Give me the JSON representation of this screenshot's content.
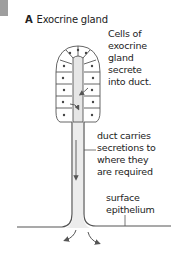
{
  "figure": {
    "panel_letter": "A",
    "title": "Exocrine gland"
  },
  "labels": {
    "cells": [
      "Cells of",
      "exocrine",
      "gland",
      "secrete",
      "into duct."
    ],
    "duct": [
      "duct carries",
      "secretions to",
      "where they",
      "are required"
    ],
    "epithelium": [
      "surface",
      "epithelium"
    ]
  },
  "colors": {
    "line": "#555555",
    "duct_fill": "#e6e6e6",
    "corner_block": "#9e9e9e"
  }
}
